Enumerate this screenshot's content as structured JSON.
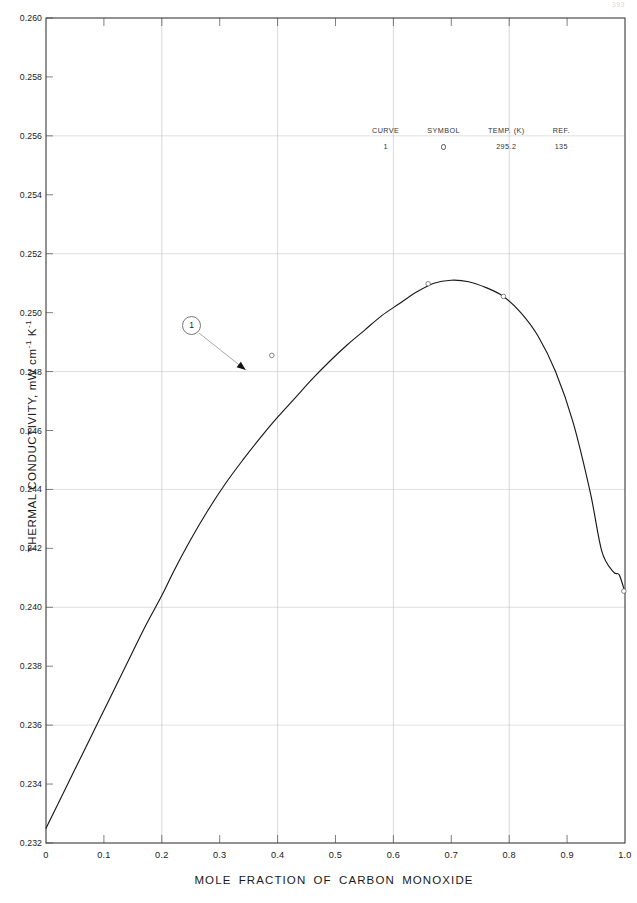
{
  "page": {
    "number": "393"
  },
  "chart_data": {
    "type": "line",
    "title": "",
    "xlabel": "MOLE  FRACTION  OF  CARBON  MONOXIDE",
    "ylabel": "THERMAL CONDUCTIVITY, mW cm",
    "ylabel_sup1": "-1",
    "ylabel_mid": " K",
    "ylabel_sup2": "-1",
    "xlim": [
      0,
      1.0
    ],
    "ylim": [
      0.232,
      0.26
    ],
    "grid": true,
    "grid_x_major": [
      0.2,
      0.4,
      0.6,
      0.8
    ],
    "grid_y_major": [
      0.236,
      0.24,
      0.244,
      0.248,
      0.252,
      0.256
    ],
    "xticks": [
      0,
      0.1,
      0.2,
      0.3,
      0.4,
      0.5,
      0.6,
      0.7,
      0.8,
      0.9,
      1.0
    ],
    "xticklabels": [
      "0",
      "0.1",
      "0.2",
      "0.3",
      "0.4",
      "0.5",
      "0.6",
      "0.7",
      "0.8",
      "0.9",
      "1.0"
    ],
    "yticks": [
      0.232,
      0.234,
      0.236,
      0.238,
      0.24,
      0.242,
      0.244,
      0.246,
      0.248,
      0.25,
      0.252,
      0.254,
      0.256,
      0.258,
      0.26
    ],
    "yticklabels": [
      "0.232",
      "0.234",
      "0.236",
      "0.238",
      "0.240",
      "0.242",
      "0.244",
      "0.246",
      "0.248",
      "0.250",
      "0.252",
      "0.254",
      "0.256",
      "0.258",
      "0.260"
    ],
    "series": [
      {
        "name": "1",
        "curve_label": "1",
        "color": "#1a1a1a",
        "x": [
          0.0,
          0.02,
          0.05,
          0.08,
          0.11,
          0.14,
          0.17,
          0.2,
          0.22,
          0.25,
          0.28,
          0.31,
          0.34,
          0.37,
          0.4,
          0.43,
          0.46,
          0.49,
          0.52,
          0.55,
          0.58,
          0.61,
          0.64,
          0.67,
          0.7,
          0.73,
          0.76,
          0.79,
          0.82,
          0.85,
          0.88,
          0.91,
          0.94,
          0.96,
          0.98,
          0.99,
          1.0
        ],
        "y": [
          0.2325,
          0.2333,
          0.2345,
          0.2357,
          0.2369,
          0.2381,
          0.2393,
          0.2404,
          0.2412,
          0.2423,
          0.2433,
          0.2442,
          0.245,
          0.24575,
          0.24645,
          0.2471,
          0.24775,
          0.24835,
          0.2489,
          0.2494,
          0.2499,
          0.2503,
          0.2507,
          0.251,
          0.2511,
          0.25105,
          0.25085,
          0.25055,
          0.25,
          0.2492,
          0.248,
          0.2463,
          0.2439,
          0.2419,
          0.2412,
          0.2411,
          0.2405
        ],
        "markers": [
          {
            "x": 0.39,
            "y": 0.24855
          },
          {
            "x": 0.66,
            "y": 0.25098
          },
          {
            "x": 0.79,
            "y": 0.25055
          },
          {
            "x": 0.998,
            "y": 0.24055
          }
        ]
      }
    ],
    "annotations": [
      {
        "type": "curve-callout",
        "label": "1",
        "target_x": 0.345,
        "target_y": 0.24805
      }
    ]
  },
  "legend": {
    "headers": [
      "CURVE",
      "SYMBOL",
      "TEMP. (K)",
      "REF."
    ],
    "rows": [
      {
        "curve": "1",
        "symbol": "open-circle",
        "temp": "295.2",
        "ref": "135"
      }
    ]
  }
}
